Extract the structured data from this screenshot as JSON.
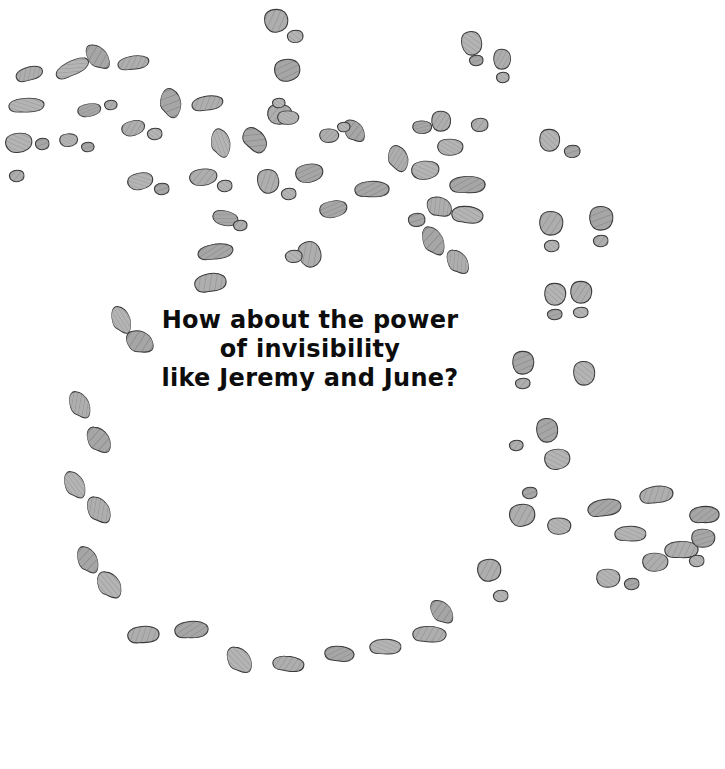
{
  "page": {
    "width": 725,
    "height": 769,
    "background_color": "#ffffff",
    "kind": "illustrated-storybook-page"
  },
  "caption": {
    "full_text": "How about the power of invisibility like Jeremy and June?",
    "lines": [
      "How about the power",
      "of invisibility",
      "like Jeremy and June?"
    ],
    "line1": "How about the power",
    "line2": "of invisibility",
    "line3": "like Jeremy and June?",
    "text_color": "#0d0d0d",
    "font_size_px": 24,
    "align": "center"
  },
  "artwork": {
    "subject": "footprints",
    "description": "Grey hatched footprints and shoeprints trailing across a white page in a wide horseshoe-shaped path",
    "fill_color": "#a9a9a9",
    "fill_color_light": "#bdbdbd",
    "outline_color": "#3a3a3a",
    "hatch_color": "#8a8a8a",
    "print_count": 178,
    "print_kinds": [
      "shoe-print",
      "bare-foot-ball",
      "bare-foot-heel"
    ],
    "prints": [
      {
        "x": 16,
        "y": 66,
        "w": 26,
        "h": 16,
        "r": -28,
        "kind": "shoe-print"
      },
      {
        "x": 55,
        "y": 60,
        "w": 34,
        "h": 17,
        "r": -35,
        "kind": "shoe-print"
      },
      {
        "x": 88,
        "y": 42,
        "w": 19,
        "h": 30,
        "r": -22,
        "kind": "shoe-print"
      },
      {
        "x": 118,
        "y": 55,
        "w": 30,
        "h": 16,
        "r": -18,
        "kind": "shoe-print"
      },
      {
        "x": 9,
        "y": 97,
        "w": 34,
        "h": 17,
        "r": -12,
        "kind": "shoe-print"
      },
      {
        "x": 78,
        "y": 103,
        "w": 22,
        "h": 14,
        "r": -10,
        "kind": "bare-foot-ball"
      },
      {
        "x": 105,
        "y": 100,
        "w": 12,
        "h": 10,
        "r": 0,
        "kind": "bare-foot-heel"
      },
      {
        "x": 6,
        "y": 132,
        "w": 25,
        "h": 21,
        "r": -8,
        "kind": "bare-foot-ball"
      },
      {
        "x": 36,
        "y": 138,
        "w": 13,
        "h": 12,
        "r": 0,
        "kind": "bare-foot-heel"
      },
      {
        "x": 10,
        "y": 170,
        "w": 14,
        "h": 12,
        "r": 0,
        "kind": "bare-foot-heel"
      },
      {
        "x": 60,
        "y": 133,
        "w": 17,
        "h": 14,
        "r": -5,
        "kind": "bare-foot-ball"
      },
      {
        "x": 82,
        "y": 142,
        "w": 12,
        "h": 10,
        "r": 0,
        "kind": "bare-foot-heel"
      },
      {
        "x": 122,
        "y": 120,
        "w": 22,
        "h": 16,
        "r": -15,
        "kind": "bare-foot-ball"
      },
      {
        "x": 148,
        "y": 128,
        "w": 14,
        "h": 12,
        "r": 0,
        "kind": "bare-foot-heel"
      },
      {
        "x": 160,
        "y": 88,
        "w": 21,
        "h": 30,
        "r": 15,
        "kind": "shoe-print"
      },
      {
        "x": 192,
        "y": 95,
        "w": 30,
        "h": 17,
        "r": -20,
        "kind": "shoe-print"
      },
      {
        "x": 128,
        "y": 172,
        "w": 24,
        "h": 18,
        "r": -12,
        "kind": "bare-foot-ball"
      },
      {
        "x": 155,
        "y": 183,
        "w": 14,
        "h": 12,
        "r": 0,
        "kind": "bare-foot-heel"
      },
      {
        "x": 190,
        "y": 168,
        "w": 26,
        "h": 18,
        "r": -8,
        "kind": "bare-foot-ball"
      },
      {
        "x": 218,
        "y": 180,
        "w": 14,
        "h": 12,
        "r": 0,
        "kind": "bare-foot-heel"
      },
      {
        "x": 198,
        "y": 243,
        "w": 34,
        "h": 18,
        "r": -18,
        "kind": "shoe-print"
      },
      {
        "x": 195,
        "y": 272,
        "w": 30,
        "h": 22,
        "r": -25,
        "kind": "shoe-print"
      },
      {
        "x": 211,
        "y": 128,
        "w": 19,
        "h": 30,
        "r": 8,
        "kind": "shoe-print"
      },
      {
        "x": 242,
        "y": 128,
        "w": 25,
        "h": 24,
        "r": 20,
        "kind": "shoe-print"
      },
      {
        "x": 265,
        "y": 8,
        "w": 22,
        "h": 25,
        "r": -10,
        "kind": "bare-foot-ball"
      },
      {
        "x": 288,
        "y": 30,
        "w": 15,
        "h": 13,
        "r": 0,
        "kind": "bare-foot-heel"
      },
      {
        "x": 275,
        "y": 58,
        "w": 24,
        "h": 24,
        "r": -8,
        "kind": "bare-foot-ball"
      },
      {
        "x": 258,
        "y": 168,
        "w": 20,
        "h": 26,
        "r": -12,
        "kind": "bare-foot-ball"
      },
      {
        "x": 282,
        "y": 188,
        "w": 14,
        "h": 12,
        "r": 0,
        "kind": "bare-foot-heel"
      },
      {
        "x": 296,
        "y": 163,
        "w": 26,
        "h": 20,
        "r": -10,
        "kind": "bare-foot-ball"
      },
      {
        "x": 268,
        "y": 103,
        "w": 23,
        "h": 22,
        "r": 0,
        "kind": "bare-foot-ball"
      },
      {
        "x": 273,
        "y": 98,
        "w": 12,
        "h": 10,
        "r": 0,
        "kind": "bare-foot-heel"
      },
      {
        "x": 213,
        "y": 210,
        "w": 24,
        "h": 16,
        "r": 12,
        "kind": "bare-foot-ball"
      },
      {
        "x": 234,
        "y": 220,
        "w": 13,
        "h": 11,
        "r": 0,
        "kind": "bare-foot-heel"
      },
      {
        "x": 278,
        "y": 110,
        "w": 20,
        "h": 15,
        "r": 0,
        "kind": "bare-foot-ball"
      },
      {
        "x": 320,
        "y": 200,
        "w": 26,
        "h": 18,
        "r": -10,
        "kind": "bare-foot-ball"
      },
      {
        "x": 299,
        "y": 240,
        "w": 21,
        "h": 28,
        "r": -20,
        "kind": "bare-foot-ball"
      },
      {
        "x": 286,
        "y": 250,
        "w": 16,
        "h": 13,
        "r": 0,
        "kind": "bare-foot-heel"
      },
      {
        "x": 345,
        "y": 118,
        "w": 18,
        "h": 26,
        "r": -15,
        "kind": "shoe-print"
      },
      {
        "x": 320,
        "y": 128,
        "w": 18,
        "h": 15,
        "r": 0,
        "kind": "bare-foot-ball"
      },
      {
        "x": 338,
        "y": 122,
        "w": 12,
        "h": 10,
        "r": 0,
        "kind": "bare-foot-heel"
      },
      {
        "x": 355,
        "y": 180,
        "w": 33,
        "h": 19,
        "r": -12,
        "kind": "shoe-print"
      },
      {
        "x": 388,
        "y": 145,
        "w": 20,
        "h": 27,
        "r": 10,
        "kind": "shoe-print"
      },
      {
        "x": 412,
        "y": 160,
        "w": 26,
        "h": 20,
        "r": -6,
        "kind": "bare-foot-ball"
      },
      {
        "x": 413,
        "y": 120,
        "w": 18,
        "h": 14,
        "r": 0,
        "kind": "bare-foot-ball"
      },
      {
        "x": 432,
        "y": 110,
        "w": 18,
        "h": 22,
        "r": 0,
        "kind": "bare-foot-ball"
      },
      {
        "x": 438,
        "y": 138,
        "w": 24,
        "h": 18,
        "r": 0,
        "kind": "bare-foot-ball"
      },
      {
        "x": 450,
        "y": 175,
        "w": 34,
        "h": 20,
        "r": -12,
        "kind": "shoe-print"
      },
      {
        "x": 428,
        "y": 195,
        "w": 22,
        "h": 24,
        "r": -18,
        "kind": "shoe-print"
      },
      {
        "x": 452,
        "y": 205,
        "w": 30,
        "h": 20,
        "r": -8,
        "kind": "shoe-print"
      },
      {
        "x": 409,
        "y": 213,
        "w": 16,
        "h": 14,
        "r": 0,
        "kind": "bare-foot-heel"
      },
      {
        "x": 472,
        "y": 118,
        "w": 16,
        "h": 14,
        "r": 0,
        "kind": "bare-foot-heel"
      },
      {
        "x": 462,
        "y": 30,
        "w": 19,
        "h": 26,
        "r": -10,
        "kind": "bare-foot-ball"
      },
      {
        "x": 470,
        "y": 55,
        "w": 13,
        "h": 11,
        "r": 0,
        "kind": "bare-foot-heel"
      },
      {
        "x": 494,
        "y": 48,
        "w": 16,
        "h": 22,
        "r": 0,
        "kind": "bare-foot-ball"
      },
      {
        "x": 497,
        "y": 72,
        "w": 12,
        "h": 11,
        "r": 0,
        "kind": "bare-foot-heel"
      },
      {
        "x": 423,
        "y": 225,
        "w": 20,
        "h": 32,
        "r": -8,
        "kind": "shoe-print"
      },
      {
        "x": 448,
        "y": 248,
        "w": 19,
        "h": 28,
        "r": -14,
        "kind": "shoe-print"
      },
      {
        "x": 540,
        "y": 128,
        "w": 19,
        "h": 24,
        "r": 0,
        "kind": "bare-foot-ball"
      },
      {
        "x": 565,
        "y": 145,
        "w": 15,
        "h": 13,
        "r": 0,
        "kind": "bare-foot-heel"
      },
      {
        "x": 540,
        "y": 210,
        "w": 22,
        "h": 26,
        "r": 0,
        "kind": "bare-foot-ball"
      },
      {
        "x": 545,
        "y": 240,
        "w": 14,
        "h": 12,
        "r": 0,
        "kind": "bare-foot-heel"
      },
      {
        "x": 590,
        "y": 205,
        "w": 22,
        "h": 26,
        "r": 0,
        "kind": "bare-foot-ball"
      },
      {
        "x": 594,
        "y": 235,
        "w": 14,
        "h": 12,
        "r": 0,
        "kind": "bare-foot-heel"
      },
      {
        "x": 545,
        "y": 282,
        "w": 20,
        "h": 24,
        "r": 0,
        "kind": "bare-foot-ball"
      },
      {
        "x": 548,
        "y": 309,
        "w": 14,
        "h": 11,
        "r": 0,
        "kind": "bare-foot-heel"
      },
      {
        "x": 571,
        "y": 280,
        "w": 20,
        "h": 24,
        "r": 0,
        "kind": "bare-foot-ball"
      },
      {
        "x": 574,
        "y": 307,
        "w": 14,
        "h": 11,
        "r": 0,
        "kind": "bare-foot-heel"
      },
      {
        "x": 513,
        "y": 350,
        "w": 20,
        "h": 25,
        "r": 0,
        "kind": "bare-foot-ball"
      },
      {
        "x": 516,
        "y": 378,
        "w": 14,
        "h": 11,
        "r": 0,
        "kind": "bare-foot-heel"
      },
      {
        "x": 574,
        "y": 360,
        "w": 20,
        "h": 26,
        "r": -5,
        "kind": "bare-foot-ball"
      },
      {
        "x": 537,
        "y": 417,
        "w": 20,
        "h": 26,
        "r": -5,
        "kind": "bare-foot-ball"
      },
      {
        "x": 510,
        "y": 440,
        "w": 13,
        "h": 11,
        "r": 0,
        "kind": "bare-foot-heel"
      },
      {
        "x": 545,
        "y": 448,
        "w": 24,
        "h": 22,
        "r": -8,
        "kind": "bare-foot-ball"
      },
      {
        "x": 523,
        "y": 487,
        "w": 14,
        "h": 12,
        "r": 0,
        "kind": "bare-foot-heel"
      },
      {
        "x": 510,
        "y": 503,
        "w": 24,
        "h": 24,
        "r": -10,
        "kind": "bare-foot-ball"
      },
      {
        "x": 548,
        "y": 517,
        "w": 22,
        "h": 18,
        "r": 0,
        "kind": "bare-foot-ball"
      },
      {
        "x": 588,
        "y": 498,
        "w": 32,
        "h": 20,
        "r": -22,
        "kind": "shoe-print"
      },
      {
        "x": 640,
        "y": 485,
        "w": 32,
        "h": 20,
        "r": -20,
        "kind": "shoe-print"
      },
      {
        "x": 615,
        "y": 525,
        "w": 30,
        "h": 18,
        "r": -12,
        "kind": "shoe-print"
      },
      {
        "x": 690,
        "y": 505,
        "w": 28,
        "h": 20,
        "r": -18,
        "kind": "shoe-print"
      },
      {
        "x": 665,
        "y": 540,
        "w": 32,
        "h": 20,
        "r": -14,
        "kind": "shoe-print"
      },
      {
        "x": 597,
        "y": 568,
        "w": 22,
        "h": 20,
        "r": 0,
        "kind": "bare-foot-ball"
      },
      {
        "x": 625,
        "y": 578,
        "w": 14,
        "h": 12,
        "r": 0,
        "kind": "bare-foot-heel"
      },
      {
        "x": 643,
        "y": 552,
        "w": 24,
        "h": 20,
        "r": 0,
        "kind": "bare-foot-ball"
      },
      {
        "x": 690,
        "y": 555,
        "w": 14,
        "h": 12,
        "r": 0,
        "kind": "bare-foot-heel"
      },
      {
        "x": 692,
        "y": 528,
        "w": 22,
        "h": 20,
        "r": 0,
        "kind": "bare-foot-ball"
      },
      {
        "x": 478,
        "y": 558,
        "w": 22,
        "h": 24,
        "r": -8,
        "kind": "bare-foot-ball"
      },
      {
        "x": 494,
        "y": 590,
        "w": 14,
        "h": 12,
        "r": 0,
        "kind": "bare-foot-heel"
      },
      {
        "x": 432,
        "y": 598,
        "w": 19,
        "h": 28,
        "r": -18,
        "kind": "shoe-print"
      },
      {
        "x": 413,
        "y": 625,
        "w": 32,
        "h": 19,
        "r": -10,
        "kind": "shoe-print"
      },
      {
        "x": 370,
        "y": 638,
        "w": 30,
        "h": 18,
        "r": -12,
        "kind": "shoe-print"
      },
      {
        "x": 325,
        "y": 645,
        "w": 28,
        "h": 18,
        "r": -8,
        "kind": "shoe-print"
      },
      {
        "x": 273,
        "y": 655,
        "w": 30,
        "h": 18,
        "r": -6,
        "kind": "shoe-print"
      },
      {
        "x": 228,
        "y": 645,
        "w": 22,
        "h": 30,
        "r": -12,
        "kind": "shoe-print"
      },
      {
        "x": 175,
        "y": 620,
        "w": 32,
        "h": 20,
        "r": -16,
        "kind": "shoe-print"
      },
      {
        "x": 128,
        "y": 625,
        "w": 30,
        "h": 20,
        "r": -18,
        "kind": "shoe-print"
      },
      {
        "x": 98,
        "y": 570,
        "w": 22,
        "h": 30,
        "r": -8,
        "kind": "shoe-print"
      },
      {
        "x": 78,
        "y": 545,
        "w": 19,
        "h": 30,
        "r": -8,
        "kind": "shoe-print"
      },
      {
        "x": 88,
        "y": 495,
        "w": 21,
        "h": 30,
        "r": -10,
        "kind": "shoe-print"
      },
      {
        "x": 65,
        "y": 470,
        "w": 19,
        "h": 30,
        "r": -8,
        "kind": "shoe-print"
      },
      {
        "x": 88,
        "y": 425,
        "w": 21,
        "h": 30,
        "r": -12,
        "kind": "shoe-print"
      },
      {
        "x": 70,
        "y": 390,
        "w": 19,
        "h": 30,
        "r": -8,
        "kind": "shoe-print"
      },
      {
        "x": 112,
        "y": 305,
        "w": 18,
        "h": 30,
        "r": -5,
        "kind": "shoe-print"
      },
      {
        "x": 128,
        "y": 328,
        "w": 23,
        "h": 28,
        "r": -25,
        "kind": "shoe-print"
      }
    ]
  }
}
